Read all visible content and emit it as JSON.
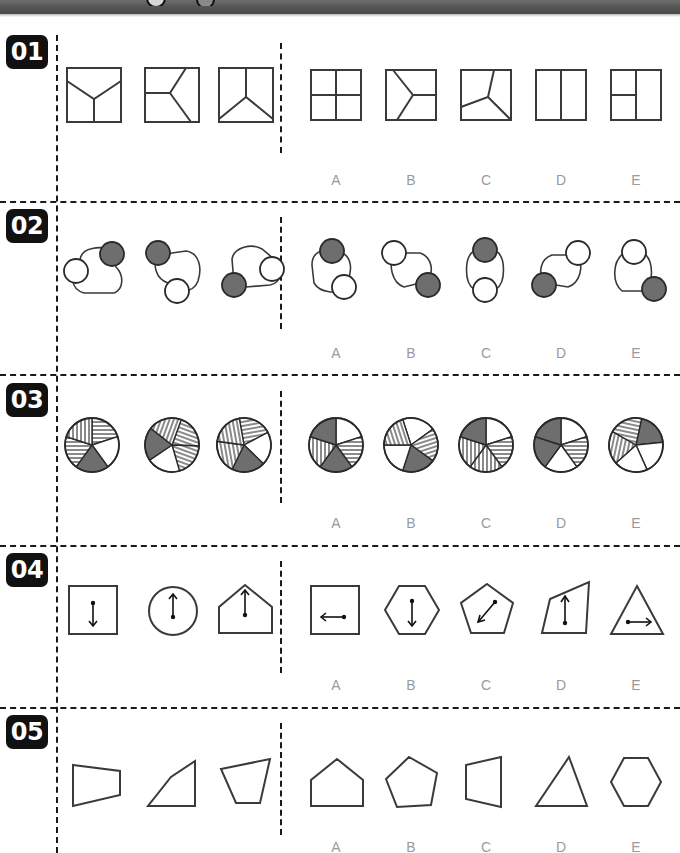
{
  "page": {
    "kind": "nonverbal-reasoning-worksheet",
    "width": 680,
    "height": 853,
    "ink_color": "#3a3a3a",
    "badge_bg": "#111111",
    "badge_fg": "#ffffff",
    "option_label_color": "#9a9a9a",
    "gray_fill": "#6e6e6e",
    "topbar_color": "#575757"
  },
  "option_labels": [
    "A",
    "B",
    "C",
    "D",
    "E"
  ],
  "rows": [
    {
      "number": "01",
      "label": "01",
      "theme": "squares divided by a rotating Y junction",
      "stems": [
        {
          "name": "square-y-up",
          "desc": "square split by Y with stem pointing down"
        },
        {
          "name": "square-y-left",
          "desc": "square split by Y opening to the left"
        },
        {
          "name": "square-y-down",
          "desc": "square split by Y with stem pointing up"
        }
      ],
      "options": [
        {
          "label": "A",
          "name": "square-cross",
          "desc": "square split into four quadrants by a cross"
        },
        {
          "label": "B",
          "name": "square-y-right",
          "desc": "square split by Y opening to the right"
        },
        {
          "label": "C",
          "name": "square-y-rotated",
          "desc": "square split by rotated Y junction"
        },
        {
          "label": "D",
          "name": "square-vertical-split",
          "desc": "square split by one vertical line"
        },
        {
          "label": "E",
          "name": "square-t-split",
          "desc": "square split by vertical line plus left horizontal"
        }
      ]
    },
    {
      "number": "02",
      "label": "02",
      "theme": "rounded loop with one shaded and one unshaded circle, rotating",
      "stems": [
        {
          "name": "loop-gray-top-right-white-left",
          "desc": "gray circle top-right, white circle left"
        },
        {
          "name": "loop-gray-top-left-white-bottom",
          "desc": "gray circle top-left, white circle bottom"
        },
        {
          "name": "loop-gray-bottom-left-white-right",
          "desc": "gray circle bottom-left, white circle right"
        }
      ],
      "options": [
        {
          "label": "A",
          "name": "loop-gray-top-white-bottom-right",
          "desc": "gray circle top, white circle bottom-right"
        },
        {
          "label": "B",
          "name": "loop-white-top-left-gray-bottom-right",
          "desc": "white circle top-left, gray circle bottom-right"
        },
        {
          "label": "C",
          "name": "loop-gray-top-white-bottom",
          "desc": "gray circle top, white circle bottom"
        },
        {
          "label": "D",
          "name": "loop-white-top-right-gray-bottom-left",
          "desc": "white circle top-right, gray circle bottom-left"
        },
        {
          "label": "E",
          "name": "loop-white-top-gray-bottom-right",
          "desc": "white circle top, gray circle bottom-right"
        }
      ]
    },
    {
      "number": "03",
      "label": "03",
      "theme": "five-sector pie circles with shaded, hatched and blank segments",
      "stems": [
        {
          "name": "pie-stem-1",
          "fills": [
            "hlines",
            "white",
            "gray",
            "hlines",
            "vlines"
          ]
        },
        {
          "name": "pie-stem-2",
          "fills": [
            "hlines",
            "hlines",
            "white",
            "gray",
            "vlines"
          ]
        },
        {
          "name": "pie-stem-3",
          "fills": [
            "hlines",
            "white",
            "gray",
            "vlines",
            "vlines"
          ]
        }
      ],
      "options": [
        {
          "label": "A",
          "name": "pie-option-a",
          "fills": [
            "white",
            "hlines",
            "gray",
            "vlines",
            "gray"
          ]
        },
        {
          "label": "B",
          "name": "pie-option-b",
          "fills": [
            "white",
            "hlines",
            "gray",
            "white",
            "vlines"
          ]
        },
        {
          "label": "C",
          "name": "pie-option-c",
          "fills": [
            "white",
            "hlines",
            "vlines",
            "vlines",
            "gray"
          ]
        },
        {
          "label": "D",
          "name": "pie-option-d",
          "fills": [
            "white",
            "hlines",
            "white",
            "gray",
            "gray"
          ]
        },
        {
          "label": "E",
          "name": "pie-option-e",
          "fills": [
            "gray",
            "white",
            "white",
            "vlines",
            "hlines"
          ]
        }
      ]
    },
    {
      "number": "04",
      "label": "04",
      "theme": "closed figures containing a double-headed arrow",
      "stems": [
        {
          "name": "square-arrow-down",
          "shape": "square",
          "arrow": "down"
        },
        {
          "name": "circle-arrow-up",
          "shape": "circle",
          "arrow": "up"
        },
        {
          "name": "house-arrow-up",
          "shape": "house",
          "arrow": "up"
        }
      ],
      "options": [
        {
          "label": "A",
          "name": "square-arrow-left",
          "shape": "square",
          "arrow": "left"
        },
        {
          "label": "B",
          "name": "hexagon-arrow-down",
          "shape": "hexagon",
          "arrow": "down"
        },
        {
          "label": "C",
          "name": "pentagon-arrow-diag",
          "shape": "pentagon",
          "arrow": "diagonal"
        },
        {
          "label": "D",
          "name": "quad-arrow-up",
          "shape": "quad",
          "arrow": "up"
        },
        {
          "label": "E",
          "name": "triangle-arrow-right",
          "shape": "triangle",
          "arrow": "right"
        }
      ]
    },
    {
      "number": "05",
      "label": "05",
      "theme": "irregular quadrilaterals versus other polygons",
      "stems": [
        {
          "name": "quad-trapezoid-left",
          "desc": "trapezoid wide on the left"
        },
        {
          "name": "quad-slanted",
          "desc": "quadrilateral slanting up to the right"
        },
        {
          "name": "quad-tapered",
          "desc": "quadrilateral tapering downward"
        }
      ],
      "options": [
        {
          "label": "A",
          "name": "pentagon-house",
          "desc": "house shaped pentagon"
        },
        {
          "label": "B",
          "name": "pentagon-regular",
          "desc": "irregular pentagon"
        },
        {
          "label": "C",
          "name": "quad-trapezoid",
          "desc": "trapezoid narrow on the right"
        },
        {
          "label": "D",
          "name": "triangle",
          "desc": "triangle"
        },
        {
          "label": "E",
          "name": "hexagon",
          "desc": "hexagon"
        }
      ]
    }
  ]
}
